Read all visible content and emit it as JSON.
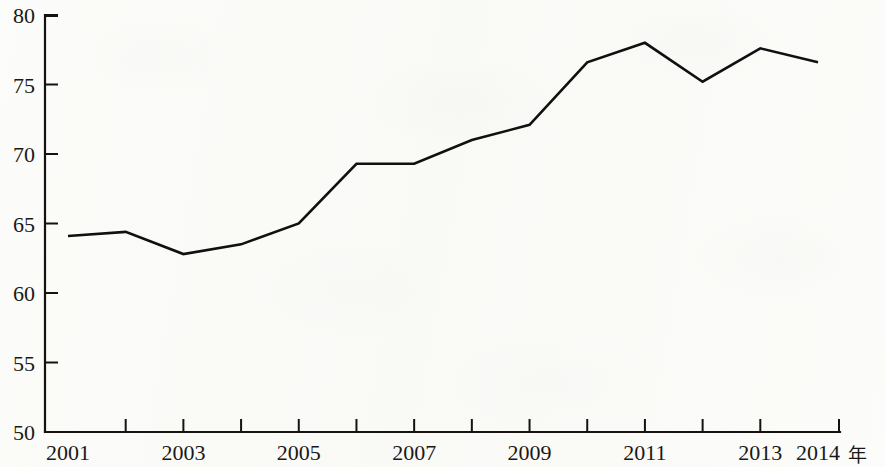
{
  "chart_data": {
    "type": "line",
    "title": "",
    "subtitle": "",
    "xlabel": "年",
    "ylabel": "",
    "x": [
      2001,
      2002,
      2003,
      2004,
      2005,
      2006,
      2007,
      2008,
      2009,
      2010,
      2011,
      2012,
      2013,
      2014
    ],
    "values": [
      64.1,
      64.4,
      62.8,
      63.5,
      65.0,
      69.3,
      69.3,
      71.0,
      72.1,
      76.6,
      78.0,
      75.2,
      77.6,
      76.6
    ],
    "series": [
      {
        "name": "",
        "values": [
          64.1,
          64.4,
          62.8,
          63.5,
          65.0,
          69.3,
          69.3,
          71.0,
          72.1,
          76.6,
          78.0,
          75.2,
          77.6,
          76.6
        ]
      }
    ],
    "xlim": [
      2001,
      2014
    ],
    "ylim": [
      50,
      80
    ],
    "ytick_labels": [
      "50",
      "55",
      "60",
      "65",
      "70",
      "75",
      "80"
    ],
    "ytick_values": [
      50,
      55,
      60,
      65,
      70,
      75,
      80
    ],
    "xtick_values": [
      2001,
      2002,
      2003,
      2004,
      2005,
      2006,
      2007,
      2008,
      2009,
      2010,
      2011,
      2012,
      2013,
      2014
    ],
    "xtick_labels_shown": [
      "2001",
      "2003",
      "2005",
      "2007",
      "2009",
      "2011",
      "2013",
      "2014"
    ],
    "xtick_label_values": [
      2001,
      2003,
      2005,
      2007,
      2009,
      2011,
      2013,
      2014
    ],
    "x_unit_suffix": "年",
    "grid": false,
    "legend": false,
    "legend_position": "none",
    "line_color": "#111010",
    "axis_color": "#15120f",
    "background_color": "#fcfcfa",
    "annotations": []
  },
  "axes": {
    "y_axis_name": "value-axis",
    "x_axis_name": "year-axis"
  }
}
